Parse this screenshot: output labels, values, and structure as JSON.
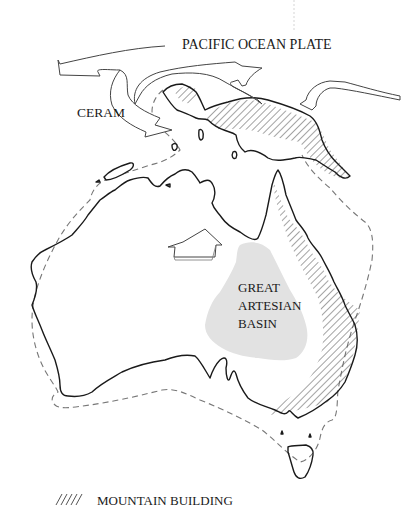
{
  "diagram": {
    "labels": {
      "plate": "PACIFIC OCEAN PLATE",
      "ceram": "CERAM",
      "basin_line1": "GREAT",
      "basin_line2": "ARTESIAN",
      "basin_line3": "BASIN"
    },
    "legend": {
      "mountain_building": "MOUNTAIN BUILDING"
    },
    "colors": {
      "outline": "#1a1a1a",
      "basin": "#e2e2e2",
      "hatch": "#555555",
      "shelf": "#777777"
    }
  }
}
